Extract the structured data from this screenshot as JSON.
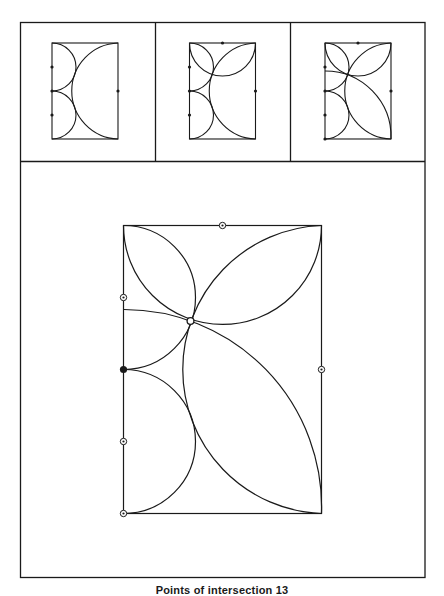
{
  "caption": "Points of intersection 13",
  "colors": {
    "stroke": "#1a1a1a",
    "background": "#ffffff"
  },
  "frame": {
    "x": 20.5,
    "y": 22.5,
    "width": 404.5,
    "height": 555,
    "row_divider_y": 161.5,
    "col_dividers_x": [
      155.5,
      290.5
    ]
  },
  "rect_size": {
    "w": 198,
    "h": 288
  },
  "circles": {
    "upper_left_semicircle": {
      "cx": 0,
      "cy": 72,
      "r": 72,
      "from": [
        0,
        0
      ],
      "to": [
        0,
        144
      ],
      "sweep": 1,
      "large": 0
    },
    "lower_left_semicircle": {
      "cx": 0,
      "cy": 216,
      "r": 72,
      "from": [
        0,
        144
      ],
      "to": [
        0,
        288
      ],
      "sweep": 1,
      "large": 0
    },
    "big_right_arc": {
      "r": 144.1,
      "from": [
        198,
        0
      ],
      "to": [
        198,
        288
      ],
      "sweep": 0,
      "large": 0
    },
    "top_arc": {
      "r": 99,
      "from": [
        0,
        0
      ],
      "to": [
        198,
        0
      ],
      "sweep": 0,
      "large": 0
    },
    "diagonal_arc": {
      "r": 197.5,
      "from": [
        0,
        84
      ],
      "to": [
        198,
        288
      ],
      "sweep": 1,
      "large": 0
    }
  },
  "panels": [
    {
      "name": "step-1",
      "origin": [
        52,
        43
      ],
      "scale": 0.3333,
      "arcs": [
        "upper_left_semicircle",
        "lower_left_semicircle",
        "big_right_arc"
      ],
      "markers": [
        {
          "type": "dot",
          "x": 0,
          "y": 72
        },
        {
          "type": "dot",
          "x": 0,
          "y": 144
        },
        {
          "type": "dot",
          "x": 0,
          "y": 216
        },
        {
          "type": "dot",
          "x": 198,
          "y": 144
        }
      ]
    },
    {
      "name": "step-2",
      "origin": [
        189.5,
        43
      ],
      "scale": 0.3333,
      "arcs": [
        "upper_left_semicircle",
        "lower_left_semicircle",
        "big_right_arc",
        "top_arc"
      ],
      "markers": [
        {
          "type": "dot",
          "x": 99,
          "y": 0
        },
        {
          "type": "dot",
          "x": 0,
          "y": 72
        },
        {
          "type": "dot",
          "x": 0,
          "y": 144
        },
        {
          "type": "dot",
          "x": 0,
          "y": 216
        },
        {
          "type": "dot",
          "x": 198,
          "y": 144
        }
      ]
    },
    {
      "name": "step-3",
      "origin": [
        325,
        43
      ],
      "scale": 0.3333,
      "arcs": [
        "upper_left_semicircle",
        "lower_left_semicircle",
        "big_right_arc",
        "top_arc",
        "diagonal_arc"
      ],
      "markers": [
        {
          "type": "dot",
          "x": 99,
          "y": 0
        },
        {
          "type": "dot",
          "x": 0,
          "y": 72
        },
        {
          "type": "dot",
          "x": 0,
          "y": 144
        },
        {
          "type": "dot",
          "x": 0,
          "y": 216
        },
        {
          "type": "dot",
          "x": 198,
          "y": 144
        },
        {
          "type": "dot",
          "x": 0,
          "y": 288
        }
      ]
    },
    {
      "name": "final",
      "origin": [
        123.5,
        225.5
      ],
      "scale": 1,
      "arcs": [
        "upper_left_semicircle",
        "lower_left_semicircle",
        "big_right_arc",
        "top_arc",
        "diagonal_arc"
      ],
      "markers": [
        {
          "type": "target",
          "x": 99,
          "y": 0
        },
        {
          "type": "target",
          "x": 0,
          "y": 72
        },
        {
          "type": "filled",
          "x": 0,
          "y": 144
        },
        {
          "type": "target",
          "x": 0,
          "y": 216
        },
        {
          "type": "target",
          "x": 198,
          "y": 144
        },
        {
          "type": "target",
          "x": 0,
          "y": 288
        },
        {
          "type": "hollow",
          "x": 67,
          "y": 95.5
        }
      ]
    }
  ]
}
